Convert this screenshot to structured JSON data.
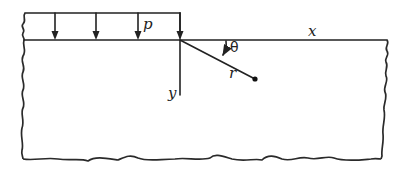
{
  "figure": {
    "labels": {
      "load": "p",
      "x_axis": "x",
      "y_axis": "y",
      "radius": "r",
      "angle": "θ"
    },
    "load_arrow_count": 4,
    "colors": {
      "ink": "#222222",
      "background": "#ffffff"
    }
  }
}
